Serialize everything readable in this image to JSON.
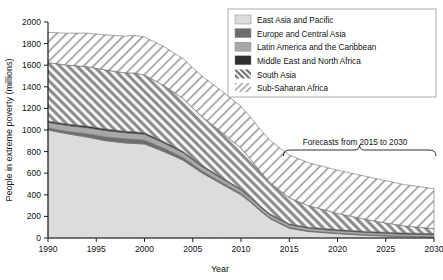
{
  "chart_data": {
    "type": "area",
    "stacked": true,
    "title": "",
    "xlabel": "Year",
    "ylabel": "People in extreme poverty (millions)",
    "xlim": [
      1990,
      2030
    ],
    "ylim": [
      0,
      2000
    ],
    "ytick_values": [
      0,
      200,
      400,
      600,
      800,
      1000,
      1200,
      1400,
      1600,
      1800,
      2000
    ],
    "ytick_labels": [
      "0",
      "200",
      "400",
      "600",
      "800",
      "1000",
      "1200",
      "1400",
      "1600",
      "1800",
      "2000"
    ],
    "xtick_values": [
      1990,
      1995,
      2000,
      2005,
      2010,
      2015,
      2020,
      2025,
      2030
    ],
    "xtick_labels": [
      "1990",
      "1995",
      "2000",
      "2005",
      "2010",
      "2015",
      "2020",
      "2025",
      "2030"
    ],
    "grid": false,
    "legend_position": "top-right",
    "x": [
      1990,
      1992,
      1994,
      1996,
      1998,
      1999,
      2000,
      2002,
      2004,
      2005,
      2006,
      2008,
      2010,
      2011,
      2012,
      2013,
      2015,
      2017,
      2020,
      2023,
      2025,
      2027,
      2030
    ],
    "series": [
      {
        "name": "East Asia and Pacific",
        "fill": "#dcdcdc",
        "pattern": "solid",
        "values": [
          1000,
          965,
          935,
          900,
          880,
          875,
          870,
          800,
          720,
          660,
          600,
          500,
          400,
          330,
          250,
          180,
          90,
          60,
          40,
          25,
          18,
          12,
          8
        ]
      },
      {
        "name": "Europe and Central Asia",
        "fill": "#6e6e6e",
        "pattern": "solid",
        "values": [
          18,
          22,
          30,
          36,
          38,
          38,
          36,
          30,
          24,
          20,
          18,
          14,
          12,
          10,
          9,
          8,
          7,
          6,
          5,
          4,
          4,
          3,
          3
        ]
      },
      {
        "name": "Latin America and the Caribbean",
        "fill": "#a8a8a8",
        "pattern": "solid",
        "values": [
          52,
          54,
          56,
          58,
          56,
          55,
          54,
          50,
          46,
          44,
          42,
          36,
          32,
          30,
          28,
          27,
          26,
          24,
          23,
          22,
          21,
          20,
          19
        ]
      },
      {
        "name": "Middle East and North Africa",
        "fill": "#2e2e2e",
        "pattern": "solid",
        "values": [
          14,
          15,
          16,
          16,
          15,
          15,
          14,
          13,
          12,
          11,
          11,
          10,
          9,
          9,
          9,
          9,
          9,
          9,
          10,
          10,
          11,
          11,
          12
        ]
      },
      {
        "name": "South Asia",
        "fill": "#f2f2f2",
        "pattern": "hatch-forward",
        "values": [
          540,
          545,
          550,
          545,
          540,
          545,
          535,
          520,
          490,
          470,
          450,
          420,
          380,
          350,
          320,
          290,
          240,
          200,
          150,
          110,
          85,
          65,
          45
        ]
      },
      {
        "name": "Sub-Saharan Africa",
        "fill": "#ffffff",
        "pattern": "hatch-back",
        "values": [
          280,
          295,
          310,
          325,
          340,
          348,
          352,
          360,
          368,
          372,
          376,
          382,
          386,
          388,
          390,
          392,
          396,
          398,
          400,
          398,
          392,
          382,
          370
        ]
      }
    ],
    "totals": [
      1904,
      1896,
      1897,
      1880,
      1869,
      1876,
      1861,
      1773,
      1660,
      1577,
      1497,
      1362,
      1219,
      1117,
      1006,
      906,
      768,
      697,
      628,
      569,
      531,
      493,
      457
    ],
    "annotation": {
      "text": "Forecasts from 2015 to 2030",
      "brace_from_year": 2015,
      "brace_to_year": 2030
    }
  },
  "legend": {
    "items": [
      {
        "label": "East Asia and Pacific",
        "swatch": "solid-lightgray"
      },
      {
        "label": "Europe and Central Asia",
        "swatch": "solid-darkgray"
      },
      {
        "label": "Latin America and the Caribbean",
        "swatch": "solid-midgray"
      },
      {
        "label": "Middle East and North Africa",
        "swatch": "solid-black"
      },
      {
        "label": "South Asia",
        "swatch": "hatch-forward"
      },
      {
        "label": "Sub-Saharan Africa",
        "swatch": "hatch-back"
      }
    ]
  },
  "colors": {
    "east_asia": "#dcdcdc",
    "europe_central_asia": "#6e6e6e",
    "latin_america": "#a8a8a8",
    "mena": "#2e2e2e",
    "axis": "#1a1a1a",
    "background": "#ffffff"
  }
}
